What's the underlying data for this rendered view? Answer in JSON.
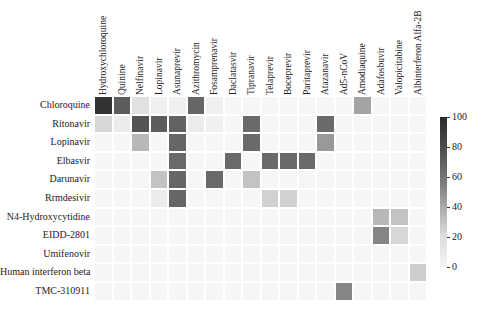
{
  "chart_data": {
    "type": "heatmap",
    "title": "",
    "xlabel": "",
    "ylabel": "",
    "columns": [
      "Hydroxychloroquine",
      "Quinine",
      "Nelfinavir",
      "Lopinavir",
      "Asunaprevir",
      "Azithromycin",
      "Fosamprenavir",
      "Daclatasvir",
      "Tipranavir",
      "Telaprevir",
      "Boceprevir",
      "Paritaprevir",
      "Atazanavir",
      "Ad5-nCoV",
      "Amodiaquine",
      "Adafosbuvir",
      "Valopicitabine",
      "Albinterferon Alfa-2B"
    ],
    "rows": [
      "Chloroquine",
      "Ritonavir",
      "Lopinavir",
      "Elbasvir",
      "Darunavir",
      "Rrmdesivir",
      "N4-Hydroxycytidine",
      "EIDD-2801",
      "Umifenovir",
      "Human interferon beta",
      "TMC-310911"
    ],
    "values": [
      [
        95,
        75,
        10,
        3,
        3,
        70,
        3,
        0,
        0,
        0,
        0,
        0,
        0,
        0,
        40,
        0,
        0,
        0
      ],
      [
        15,
        5,
        78,
        75,
        72,
        5,
        3,
        0,
        68,
        0,
        0,
        0,
        68,
        0,
        0,
        0,
        0,
        0
      ],
      [
        0,
        0,
        30,
        0,
        70,
        0,
        0,
        0,
        68,
        0,
        0,
        0,
        45,
        0,
        0,
        0,
        0,
        0
      ],
      [
        0,
        0,
        0,
        0,
        68,
        0,
        0,
        68,
        0,
        68,
        68,
        68,
        0,
        0,
        0,
        0,
        0,
        0
      ],
      [
        0,
        0,
        0,
        25,
        70,
        0,
        68,
        0,
        25,
        0,
        0,
        0,
        0,
        0,
        0,
        0,
        0,
        0
      ],
      [
        0,
        0,
        0,
        5,
        70,
        0,
        0,
        0,
        0,
        18,
        18,
        0,
        0,
        0,
        0,
        0,
        0,
        0
      ],
      [
        0,
        0,
        0,
        0,
        0,
        0,
        0,
        0,
        0,
        0,
        0,
        0,
        0,
        0,
        0,
        30,
        25,
        0
      ],
      [
        0,
        0,
        0,
        0,
        0,
        0,
        0,
        0,
        0,
        0,
        0,
        0,
        0,
        0,
        0,
        55,
        15,
        0
      ],
      [
        0,
        0,
        0,
        0,
        0,
        0,
        0,
        0,
        0,
        0,
        0,
        0,
        0,
        0,
        0,
        0,
        0,
        0
      ],
      [
        0,
        0,
        0,
        0,
        0,
        0,
        0,
        0,
        0,
        0,
        0,
        0,
        0,
        0,
        0,
        0,
        0,
        20
      ],
      [
        0,
        0,
        0,
        0,
        0,
        0,
        0,
        0,
        0,
        0,
        0,
        0,
        0,
        55,
        0,
        0,
        0,
        0
      ]
    ],
    "colorbar": {
      "min": 0,
      "max": 100,
      "ticks": [
        "100",
        "80",
        "60",
        "40",
        "20",
        "0"
      ],
      "colormap": "greys"
    },
    "grid": false,
    "legend_position": "right"
  }
}
